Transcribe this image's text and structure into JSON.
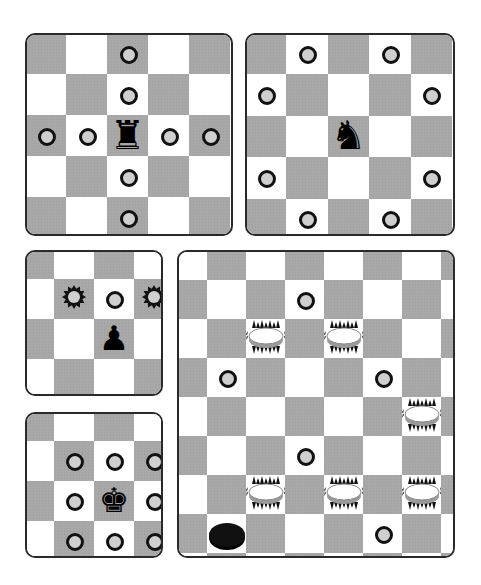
{
  "colors": {
    "dark_square": "#a8a8a8",
    "light_square": "#ffffff",
    "border": "#2a2a2a",
    "marker_fill": "#cfcfcf",
    "marker_ring": "#111111",
    "piece": "#000000"
  },
  "icons": {
    "rook": "♜",
    "knight": "♞",
    "pawn": "♟",
    "king": "♚"
  },
  "boards": [
    {
      "id": "rook-board",
      "piece": "rook",
      "piece_glyph": "♜",
      "size": 5,
      "top_left_dark": true,
      "piece_pos": [
        2,
        2
      ],
      "markers": [
        [
          0,
          2
        ],
        [
          1,
          2
        ],
        [
          2,
          0
        ],
        [
          2,
          1
        ],
        [
          2,
          3
        ],
        [
          2,
          4
        ],
        [
          3,
          2
        ],
        [
          4,
          2
        ]
      ]
    },
    {
      "id": "knight-board",
      "piece": "knight",
      "piece_glyph": "♞",
      "size": 5,
      "top_left_dark": true,
      "piece_pos": [
        2,
        2
      ],
      "markers": [
        [
          0,
          1
        ],
        [
          0,
          3
        ],
        [
          1,
          0
        ],
        [
          1,
          4
        ],
        [
          3,
          0
        ],
        [
          3,
          4
        ],
        [
          4,
          1
        ],
        [
          4,
          3
        ]
      ]
    },
    {
      "id": "pawn-board",
      "piece": "pawn",
      "piece_glyph": "♟",
      "size": 3,
      "top_left_dark": true,
      "piece_pos": [
        1,
        1
      ],
      "markers": [
        [
          0,
          1
        ]
      ],
      "captures": [
        [
          0,
          0
        ],
        [
          0,
          2
        ]
      ]
    },
    {
      "id": "king-board",
      "piece": "king",
      "piece_glyph": "♚",
      "size": 3,
      "top_left_dark": true,
      "piece_pos": [
        1,
        1
      ],
      "markers": [
        [
          0,
          0
        ],
        [
          0,
          1
        ],
        [
          0,
          2
        ],
        [
          1,
          0
        ],
        [
          1,
          2
        ],
        [
          2,
          0
        ],
        [
          2,
          1
        ],
        [
          2,
          2
        ]
      ]
    },
    {
      "id": "checkers-board",
      "piece": "checker",
      "cols": 7,
      "rows": 8,
      "top_left_dark": false,
      "dark_checker": [
        6,
        0
      ],
      "light_checkers": [
        [
          1,
          1
        ],
        [
          1,
          3
        ],
        [
          3,
          5
        ],
        [
          5,
          1
        ],
        [
          5,
          3
        ],
        [
          5,
          5
        ]
      ],
      "markers": [
        [
          0,
          2
        ],
        [
          2,
          0
        ],
        [
          2,
          4
        ],
        [
          4,
          2
        ],
        [
          4,
          6
        ],
        [
          6,
          4
        ]
      ]
    }
  ]
}
